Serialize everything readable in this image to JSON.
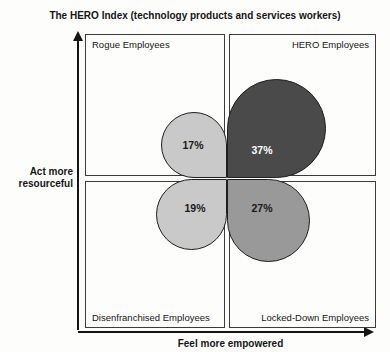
{
  "title": "The HERO Index (technology products and services workers)",
  "y_axis_label": "Act more resourceful",
  "x_axis_label": "Feel more empowered",
  "quadrants": [
    {
      "label": "Rogue Employees",
      "position": "top-left"
    },
    {
      "label": "HERO Employees",
      "position": "top-right"
    },
    {
      "label": "Disenfranchised Employees",
      "position": "bottom-left"
    },
    {
      "label": "Locked-Down Employees",
      "position": "bottom-right"
    }
  ],
  "petals": [
    {
      "quadrant": "top-left",
      "label": "Rogue Employees",
      "value": "17%",
      "fill": "#c9c9c9",
      "text_color": "#1a1a1a"
    },
    {
      "quadrant": "top-right",
      "label": "HERO Employees",
      "value": "37%",
      "fill": "#4a4a4a",
      "text_color": "#ffffff"
    },
    {
      "quadrant": "bottom-left",
      "label": "Disenfranchised Employees",
      "value": "19%",
      "fill": "#c9c9c9",
      "text_color": "#1a1a1a"
    },
    {
      "quadrant": "bottom-right",
      "label": "Locked-Down Employees",
      "value": "27%",
      "fill": "#999999",
      "text_color": "#1a1a1a"
    }
  ],
  "chart_data": {
    "type": "quadrant-petal",
    "title": "The HERO Index (technology products and services workers)",
    "xlabel": "Feel more empowered",
    "ylabel": "Act more resourceful",
    "categories": [
      "Rogue Employees",
      "HERO Employees",
      "Disenfranchised Employees",
      "Locked-Down Employees"
    ],
    "values": [
      17,
      37,
      19,
      27
    ],
    "unit": "%",
    "positions": [
      "top-left",
      "top-right",
      "bottom-left",
      "bottom-right"
    ],
    "legend_position": "none",
    "grid": "2x2 quadrant boxes",
    "petal_area_proportional_to_value": true
  }
}
